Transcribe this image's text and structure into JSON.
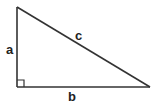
{
  "diagram": {
    "type": "right-triangle",
    "title": "",
    "labels": {
      "a": "a",
      "b": "b",
      "c": "c"
    },
    "vertices": {
      "top": [
        17,
        7
      ],
      "right_angle": [
        17,
        87
      ],
      "bottom_right": [
        150,
        87
      ]
    },
    "right_angle_marker_size": 7,
    "colors": {
      "stroke": "#333333",
      "label": "#222222",
      "background": "#ffffff"
    }
  }
}
